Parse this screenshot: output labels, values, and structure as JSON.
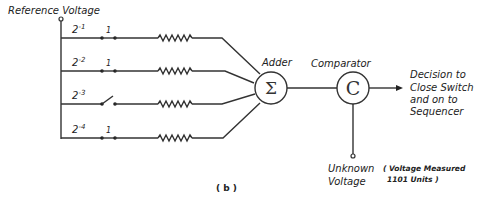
{
  "diagram": {
    "reference_label": "Reference Voltage",
    "branches": [
      {
        "weight_base": "2",
        "weight_exp": "-1",
        "switch_state": "1",
        "closed": true
      },
      {
        "weight_base": "2",
        "weight_exp": "-2",
        "switch_state": "1",
        "closed": true
      },
      {
        "weight_base": "2",
        "weight_exp": "-3",
        "switch_state": "",
        "closed": false
      },
      {
        "weight_base": "2",
        "weight_exp": "-4",
        "switch_state": "1",
        "closed": true
      }
    ],
    "adder": {
      "label": "Adder",
      "symbol": "Σ"
    },
    "comparator": {
      "label": "Comparator",
      "symbol": "C"
    },
    "output": {
      "lines": [
        "Decision to",
        "Close Switch",
        "and on to",
        "Sequencer"
      ]
    },
    "unknown": {
      "lines": [
        "Unknown",
        "Voltage"
      ],
      "note_lines": [
        "( Voltage Measured",
        "1101 Units )"
      ]
    },
    "caption": "( b )"
  }
}
